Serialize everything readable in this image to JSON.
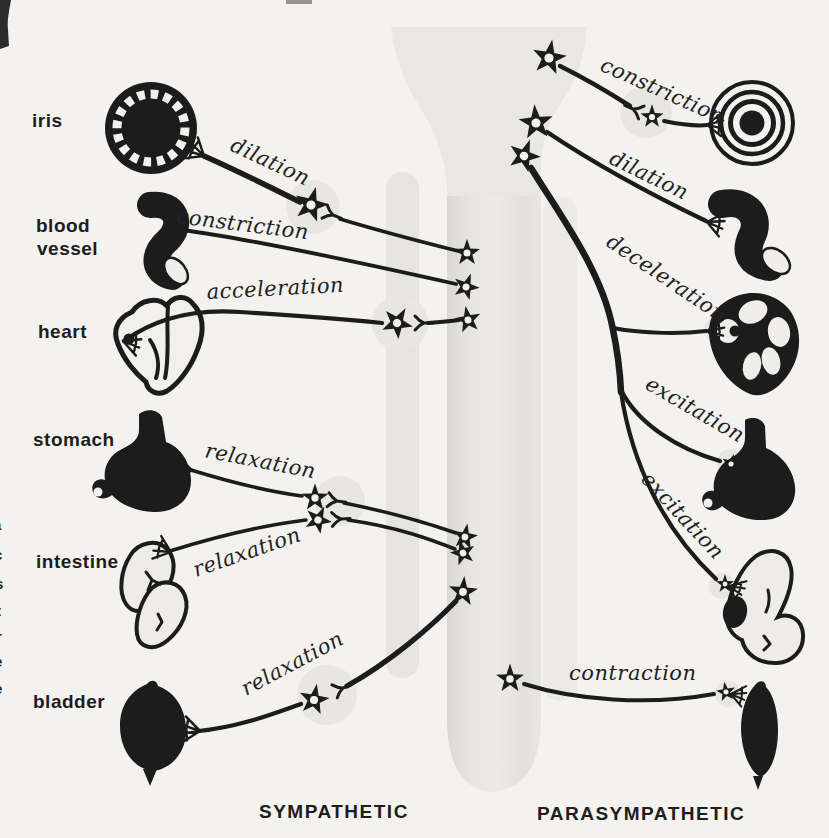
{
  "diagram": {
    "organ_labels": {
      "iris": "iris",
      "blood_vessel_line1": "blood",
      "blood_vessel_line2": "vessel",
      "heart": "heart",
      "stomach": "stomach",
      "intestine": "intestine",
      "bladder": "bladder"
    },
    "sympathetic": {
      "title": "SYMPATHETIC",
      "effects": {
        "iris": "dilation",
        "blood_vessel": "constriction",
        "heart": "acceleration",
        "stomach": "relaxation",
        "intestine": "relaxation",
        "bladder": "relaxation"
      }
    },
    "parasympathetic": {
      "title": "PARASYMPATHETIC",
      "effects": {
        "iris": "constriction",
        "blood_vessel": "dilation",
        "heart": "deceleration",
        "stomach": "excitation",
        "intestine": "excitation",
        "bladder": "contraction"
      }
    },
    "edge_fragments": [
      "f",
      "a",
      "c",
      "s",
      "t",
      "r",
      "e",
      "e"
    ],
    "colors": {
      "background": "#f3f2ee",
      "ink": "#1c1c1c",
      "column_gray": "#e2e1dc",
      "halo_gray": "#e8e6e0"
    }
  }
}
